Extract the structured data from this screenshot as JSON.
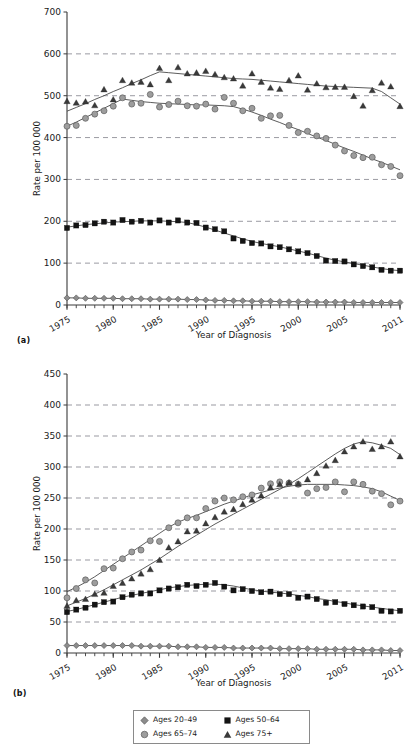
{
  "figure": {
    "panel_a_tag": "(a)",
    "panel_b_tag": "(b)"
  },
  "legend": {
    "items": [
      {
        "label": "Ages 20–49",
        "marker": "diamond-marker",
        "color": "#8c8c8c"
      },
      {
        "label": "Ages 50–64",
        "marker": "square-marker",
        "color": "#141414"
      },
      {
        "label": "Ages 65–74",
        "marker": "circle-marker",
        "color": "#9d9d9d"
      },
      {
        "label": "Ages 75+",
        "marker": "triangle-marker",
        "color": "#3a3a3a"
      }
    ]
  },
  "chart_data": [
    {
      "panel": "(a)",
      "type": "scatter",
      "title": "",
      "xlabel": "Year of Diagnosis",
      "ylabel": "Rate per 100 000",
      "xlim": [
        1975,
        2011
      ],
      "ylim": [
        0,
        700
      ],
      "yticks": [
        0,
        100,
        200,
        300,
        400,
        500,
        600,
        700
      ],
      "xticks": [
        1975,
        1980,
        1985,
        1990,
        1995,
        2000,
        2005,
        2011
      ],
      "xtick_labels": [
        "1975",
        "1980",
        "1985",
        "1990",
        "1995",
        "2000",
        "2005",
        "2011"
      ],
      "grid": "horizontal-dashed",
      "legend_position": "below-figure",
      "x": [
        1975,
        1976,
        1977,
        1978,
        1979,
        1980,
        1981,
        1982,
        1983,
        1984,
        1985,
        1986,
        1987,
        1988,
        1989,
        1990,
        1991,
        1992,
        1993,
        1994,
        1995,
        1996,
        1997,
        1998,
        1999,
        2000,
        2001,
        2002,
        2003,
        2004,
        2005,
        2006,
        2007,
        2008,
        2009,
        2010,
        2011
      ],
      "series": [
        {
          "name": "Ages 20–49",
          "marker": "diamond-marker",
          "color": "#8c8c8c",
          "values": [
            17,
            17,
            16,
            16,
            16,
            16,
            15,
            15,
            15,
            14,
            14,
            14,
            14,
            13,
            13,
            12,
            11,
            11,
            10,
            10,
            9,
            9,
            9,
            8,
            8,
            8,
            8,
            7,
            7,
            7,
            7,
            6,
            6,
            6,
            6,
            6,
            6
          ],
          "trend": [
            17,
            17,
            16,
            16,
            16,
            16,
            15,
            15,
            15,
            14,
            14,
            14,
            14,
            13,
            13,
            12,
            11,
            11,
            10,
            10,
            9,
            9,
            9,
            8,
            8,
            8,
            8,
            7,
            7,
            7,
            7,
            6,
            6,
            6,
            6,
            6,
            6
          ]
        },
        {
          "name": "Ages 50–64",
          "marker": "square-marker",
          "color": "#141414",
          "values": [
            184,
            190,
            191,
            195,
            199,
            197,
            203,
            199,
            201,
            197,
            202,
            197,
            202,
            197,
            196,
            185,
            181,
            176,
            159,
            153,
            148,
            147,
            140,
            138,
            133,
            128,
            124,
            117,
            106,
            105,
            104,
            97,
            93,
            90,
            84,
            82,
            82
          ],
          "trend": [
            186,
            189,
            192,
            194,
            196,
            198,
            199,
            200,
            201,
            201,
            201,
            200,
            199,
            197,
            192,
            186,
            179,
            172,
            165,
            158,
            152,
            147,
            143,
            139,
            134,
            129,
            124,
            118,
            112,
            107,
            103,
            99,
            95,
            91,
            87,
            84,
            82
          ]
        },
        {
          "name": "Ages 65–74",
          "marker": "circle-marker",
          "color": "#9d9d9d",
          "values": [
            427,
            429,
            446,
            456,
            464,
            475,
            495,
            480,
            482,
            503,
            473,
            479,
            487,
            476,
            475,
            480,
            468,
            496,
            482,
            464,
            470,
            446,
            452,
            453,
            429,
            412,
            415,
            404,
            398,
            382,
            368,
            357,
            352,
            353,
            335,
            331,
            309
          ],
          "trend": [
            427,
            437,
            448,
            459,
            470,
            481,
            492,
            489,
            486,
            484,
            482,
            481,
            480,
            479,
            478,
            478,
            477,
            476,
            474,
            468,
            461,
            453,
            444,
            436,
            427,
            419,
            410,
            401,
            393,
            384,
            375,
            367,
            358,
            349,
            341,
            332,
            323
          ]
        },
        {
          "name": "Ages 75+",
          "marker": "triangle-marker",
          "color": "#3a3a3a",
          "values": [
            487,
            483,
            486,
            477,
            515,
            491,
            537,
            531,
            533,
            527,
            566,
            537,
            568,
            553,
            555,
            559,
            551,
            544,
            541,
            524,
            553,
            533,
            519,
            516,
            537,
            548,
            514,
            529,
            520,
            521,
            521,
            499,
            476,
            513,
            531,
            522,
            475
          ],
          "trend": [
            463,
            472,
            481,
            491,
            500,
            510,
            519,
            529,
            538,
            548,
            557,
            555,
            553,
            551,
            549,
            547,
            545,
            543,
            541,
            540,
            539,
            537,
            535,
            533,
            531,
            529,
            527,
            525,
            523,
            522,
            521,
            520,
            519,
            518,
            510,
            495,
            480
          ]
        }
      ]
    },
    {
      "panel": "(b)",
      "type": "scatter",
      "title": "",
      "xlabel": "Year of Diagnosis",
      "ylabel": "Rate per 100 000",
      "xlim": [
        1975,
        2011
      ],
      "ylim": [
        0,
        450
      ],
      "yticks": [
        0,
        50,
        100,
        150,
        200,
        250,
        300,
        350,
        400,
        450
      ],
      "xticks": [
        1975,
        1980,
        1985,
        1990,
        1995,
        2000,
        2005,
        2011
      ],
      "xtick_labels": [
        "1975",
        "1980",
        "1985",
        "1990",
        "1995",
        "2000",
        "2005",
        "2011"
      ],
      "grid": "horizontal-dashed",
      "legend_position": "below-figure",
      "x": [
        1975,
        1976,
        1977,
        1978,
        1979,
        1980,
        1981,
        1982,
        1983,
        1984,
        1985,
        1986,
        1987,
        1988,
        1989,
        1990,
        1991,
        1992,
        1993,
        1994,
        1995,
        1996,
        1997,
        1998,
        1999,
        2000,
        2001,
        2002,
        2003,
        2004,
        2005,
        2006,
        2007,
        2008,
        2009,
        2010,
        2011
      ],
      "series": [
        {
          "name": "Ages 20–49",
          "marker": "diamond-marker",
          "color": "#8c8c8c",
          "values": [
            12,
            12,
            12,
            12,
            12,
            12,
            12,
            12,
            11,
            11,
            11,
            11,
            10,
            10,
            10,
            9,
            9,
            9,
            8,
            8,
            8,
            8,
            8,
            7,
            7,
            7,
            7,
            6,
            6,
            6,
            6,
            6,
            5,
            5,
            5,
            4,
            4
          ],
          "trend": [
            12,
            12,
            12,
            12,
            12,
            12,
            12,
            12,
            11,
            11,
            11,
            11,
            10,
            10,
            10,
            9,
            9,
            9,
            8,
            8,
            8,
            8,
            8,
            7,
            7,
            7,
            7,
            6,
            6,
            6,
            6,
            6,
            5,
            5,
            5,
            4,
            4
          ]
        },
        {
          "name": "Ages 50–64",
          "marker": "square-marker",
          "color": "#141414",
          "values": [
            66,
            70,
            73,
            78,
            82,
            83,
            90,
            94,
            96,
            96,
            101,
            104,
            106,
            110,
            108,
            110,
            113,
            107,
            101,
            103,
            100,
            98,
            99,
            95,
            95,
            89,
            91,
            87,
            81,
            82,
            79,
            77,
            75,
            74,
            68,
            67,
            68
          ],
          "trend": [
            67,
            70,
            74,
            78,
            82,
            86,
            90,
            93,
            96,
            99,
            102,
            105,
            107,
            109,
            110,
            111,
            111,
            110,
            108,
            105,
            102,
            100,
            98,
            97,
            95,
            93,
            91,
            88,
            86,
            83,
            81,
            78,
            76,
            74,
            72,
            70,
            68
          ]
        },
        {
          "name": "Ages 65–74",
          "marker": "circle-marker",
          "color": "#9d9d9d",
          "values": [
            89,
            104,
            118,
            113,
            136,
            137,
            152,
            163,
            166,
            181,
            180,
            202,
            210,
            218,
            218,
            233,
            245,
            250,
            247,
            252,
            255,
            266,
            273,
            276,
            274,
            272,
            258,
            265,
            267,
            276,
            260,
            276,
            272,
            261,
            257,
            239,
            245
          ],
          "trend": [
            99,
            106,
            114,
            123,
            133,
            143,
            153,
            163,
            173,
            183,
            193,
            203,
            211,
            217,
            222,
            228,
            234,
            240,
            245,
            250,
            255,
            259,
            263,
            266,
            269,
            271,
            272,
            272,
            272,
            272,
            271,
            270,
            268,
            265,
            260,
            253,
            246
          ]
        },
        {
          "name": "Ages 75+",
          "marker": "triangle-marker",
          "color": "#3a3a3a",
          "values": [
            76,
            85,
            87,
            95,
            97,
            108,
            113,
            120,
            128,
            135,
            150,
            170,
            180,
            196,
            197,
            209,
            219,
            228,
            232,
            240,
            247,
            254,
            267,
            272,
            275,
            273,
            280,
            290,
            302,
            311,
            325,
            333,
            341,
            329,
            333,
            341,
            317
          ],
          "trend": [
            76,
            82,
            88,
            95,
            102,
            110,
            118,
            126,
            134,
            143,
            152,
            162,
            172,
            181,
            190,
            199,
            208,
            216,
            224,
            232,
            240,
            248,
            256,
            264,
            272,
            281,
            291,
            301,
            311,
            321,
            330,
            337,
            341,
            339,
            335,
            330,
            320
          ]
        }
      ]
    }
  ]
}
